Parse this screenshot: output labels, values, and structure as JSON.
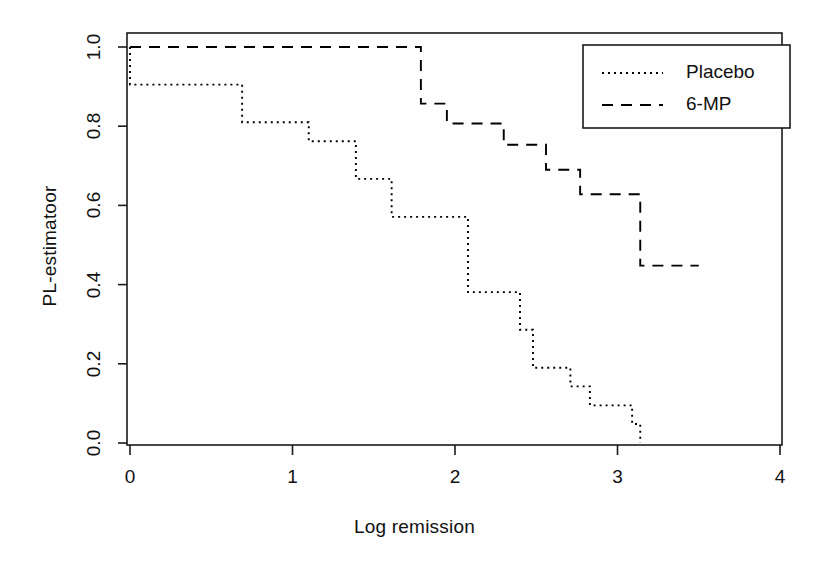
{
  "chart_data": {
    "type": "line",
    "subtype": "kaplan-meier-step",
    "title": "",
    "xlabel": "Log remission",
    "ylabel": "PL-estimatoor",
    "xlim": [
      0,
      4
    ],
    "ylim": [
      0.0,
      1.0
    ],
    "xticks": [
      0,
      1,
      2,
      3,
      4
    ],
    "xtick_labels": [
      "0",
      "1",
      "2",
      "3",
      "4"
    ],
    "yticks": [
      0.0,
      0.2,
      0.4,
      0.6,
      0.8,
      1.0
    ],
    "ytick_labels": [
      "0.0",
      "0.2",
      "0.4",
      "0.6",
      "0.8",
      "1.0"
    ],
    "grid": false,
    "legend_position": "top-right",
    "series": [
      {
        "name": "Placebo",
        "linestyle": "dotted",
        "color": "#000000",
        "x": [
          0.0,
          0.0,
          0.69,
          0.69,
          1.1,
          1.1,
          1.39,
          1.39,
          1.61,
          1.61,
          2.08,
          2.08,
          2.4,
          2.4,
          2.48,
          2.48,
          2.71,
          2.71,
          2.83,
          2.83,
          3.09,
          3.09,
          3.14,
          3.14
        ],
        "y": [
          1.0,
          0.905,
          0.905,
          0.81,
          0.81,
          0.762,
          0.762,
          0.667,
          0.667,
          0.571,
          0.571,
          0.381,
          0.381,
          0.286,
          0.286,
          0.19,
          0.19,
          0.143,
          0.143,
          0.095,
          0.095,
          0.048,
          0.048,
          0.0
        ],
        "steps": [
          {
            "x": 0.0,
            "value": 0.905
          },
          {
            "x": 0.69,
            "value": 0.81
          },
          {
            "x": 1.1,
            "value": 0.762
          },
          {
            "x": 1.39,
            "value": 0.667
          },
          {
            "x": 1.61,
            "value": 0.571
          },
          {
            "x": 2.08,
            "value": 0.381
          },
          {
            "x": 2.4,
            "value": 0.286
          },
          {
            "x": 2.48,
            "value": 0.19
          },
          {
            "x": 2.71,
            "value": 0.143
          },
          {
            "x": 2.83,
            "value": 0.095
          },
          {
            "x": 3.09,
            "value": 0.048
          },
          {
            "x": 3.14,
            "value": 0.0
          }
        ]
      },
      {
        "name": "6-MP",
        "linestyle": "dashed",
        "color": "#000000",
        "x": [
          0.0,
          1.79,
          1.79,
          1.95,
          1.95,
          2.3,
          2.3,
          2.56,
          2.56,
          2.77,
          2.77,
          3.14,
          3.14,
          3.5
        ],
        "y": [
          1.0,
          1.0,
          0.857,
          0.857,
          0.807,
          0.807,
          0.753,
          0.753,
          0.69,
          0.69,
          0.628,
          0.628,
          0.448,
          0.448
        ],
        "steps": [
          {
            "x": 1.79,
            "value": 0.857
          },
          {
            "x": 1.95,
            "value": 0.807
          },
          {
            "x": 2.3,
            "value": 0.753
          },
          {
            "x": 2.56,
            "value": 0.69
          },
          {
            "x": 2.77,
            "value": 0.628
          },
          {
            "x": 3.14,
            "value": 0.448
          }
        ],
        "end_x": 3.5
      }
    ],
    "legend": [
      {
        "label": "Placebo",
        "linestyle": "dotted"
      },
      {
        "label": "6-MP",
        "linestyle": "dashed"
      }
    ]
  },
  "axes": {
    "x_title": "Log remission",
    "y_title": "PL-estimatoor",
    "x_tick_labels": [
      "0",
      "1",
      "2",
      "3",
      "4"
    ],
    "y_tick_labels": [
      "0.0",
      "0.2",
      "0.4",
      "0.6",
      "0.8",
      "1.0"
    ]
  },
  "legend": {
    "items": [
      {
        "label": "Placebo"
      },
      {
        "label": "6-MP"
      }
    ]
  },
  "style": {
    "axis_color": "#1a1a1a",
    "line_color": "#000000",
    "background": "#fefefe"
  }
}
